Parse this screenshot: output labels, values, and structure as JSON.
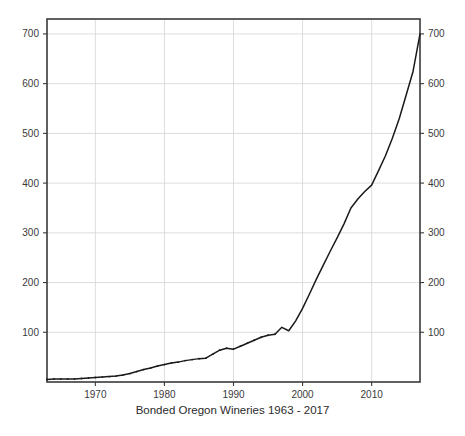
{
  "chart_data": {
    "type": "line",
    "title": "Bonded Oregon Wineries 1963 - 2017",
    "xlabel": "",
    "ylabel": "",
    "xlim": [
      1963,
      2017
    ],
    "ylim": [
      0,
      730
    ],
    "grid": true,
    "legend": null,
    "legend_position": "none",
    "line_color": "#1a1a1a",
    "grid_color": "#d4d4d4",
    "frame_color": "#3a3a3a",
    "background_color": "#ffffff",
    "x_tick_labels": [
      "1970",
      "1980",
      "1990",
      "2000",
      "2010"
    ],
    "x_tick_values": [
      1970,
      1980,
      1990,
      2000,
      2010
    ],
    "y_tick_labels": [
      "100",
      "200",
      "300",
      "400",
      "500",
      "600",
      "700"
    ],
    "y_tick_values": [
      100,
      200,
      300,
      400,
      500,
      600,
      700
    ],
    "y_axis_left": true,
    "y_axis_right": true,
    "series": [
      {
        "name": "Bonded Oregon Wineries",
        "x": [
          1963,
          1964,
          1965,
          1966,
          1967,
          1968,
          1969,
          1970,
          1971,
          1972,
          1973,
          1974,
          1975,
          1976,
          1977,
          1978,
          1979,
          1980,
          1981,
          1982,
          1983,
          1984,
          1985,
          1986,
          1987,
          1988,
          1989,
          1990,
          1991,
          1992,
          1993,
          1994,
          1995,
          1996,
          1997,
          1998,
          1999,
          2000,
          2001,
          2002,
          2003,
          2004,
          2005,
          2006,
          2007,
          2008,
          2009,
          2010,
          2011,
          2012,
          2013,
          2014,
          2015,
          2016,
          2017
        ],
        "values": [
          5,
          6,
          6,
          6,
          6,
          7,
          8,
          9,
          10,
          11,
          12,
          14,
          17,
          21,
          25,
          28,
          32,
          35,
          38,
          40,
          43,
          45,
          47,
          48,
          56,
          64,
          68,
          66,
          72,
          78,
          84,
          90,
          94,
          96,
          110,
          103,
          123,
          148,
          177,
          207,
          235,
          263,
          290,
          318,
          350,
          368,
          383,
          396,
          425,
          455,
          490,
          530,
          577,
          625,
          700
        ]
      }
    ]
  }
}
